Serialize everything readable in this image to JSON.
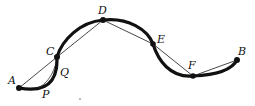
{
  "diagram": {
    "colors": {
      "curve": "#111111",
      "chord": "#333333",
      "point": "#111111"
    },
    "points": [
      {
        "id": "A",
        "label": "A",
        "x": 19,
        "y": 88,
        "lx": 8,
        "ly": 84
      },
      {
        "id": "C",
        "label": "C",
        "x": 57,
        "y": 57,
        "lx": 46,
        "ly": 54
      },
      {
        "id": "D",
        "label": "D",
        "x": 103,
        "y": 20,
        "lx": 98,
        "ly": 14
      },
      {
        "id": "E",
        "label": "E",
        "x": 153,
        "y": 44,
        "lx": 157,
        "ly": 43
      },
      {
        "id": "F",
        "label": "F",
        "x": 193,
        "y": 76,
        "lx": 188,
        "ly": 69
      },
      {
        "id": "B",
        "label": "B",
        "x": 237,
        "y": 60,
        "lx": 238,
        "ly": 54
      }
    ],
    "extra_labels": [
      {
        "id": "Q",
        "label": "Q",
        "x": 60,
        "y": 76
      },
      {
        "id": "P",
        "label": "P",
        "x": 42,
        "y": 98
      }
    ]
  }
}
